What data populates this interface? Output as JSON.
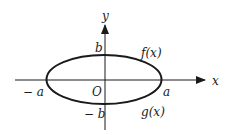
{
  "diagram": {
    "type": "ellipse-on-axes",
    "axes": {
      "x_label": "x",
      "y_label": "y",
      "origin_label": "O"
    },
    "ellipse": {
      "semi_major_label_pos": "a",
      "semi_major_label_neg": "− a",
      "semi_minor_label_pos": "b",
      "semi_minor_label_neg": "− b"
    },
    "curves": {
      "upper": "f(x)",
      "lower": "g(x)"
    },
    "colors": {
      "stroke": "#1a1a1a",
      "background": "#ffffff"
    }
  }
}
